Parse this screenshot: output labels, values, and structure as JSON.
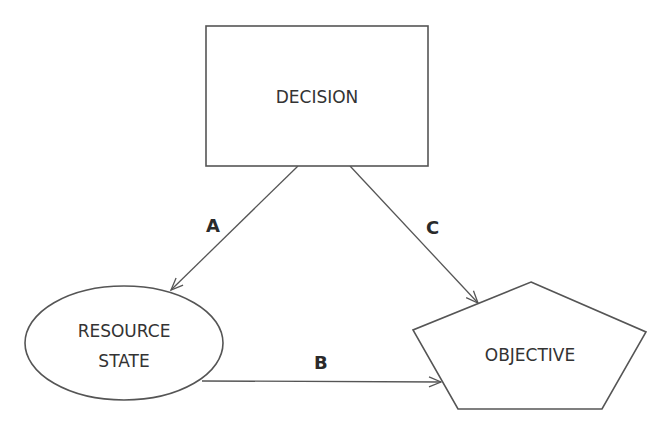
{
  "diagram": {
    "nodes": {
      "decision": {
        "label": "DECISION",
        "shape": "rectangle"
      },
      "resource_state": {
        "label_line1": "RESOURCE",
        "label_line2": "STATE",
        "shape": "ellipse"
      },
      "objective": {
        "label": "OBJECTIVE",
        "shape": "pentagon"
      }
    },
    "edges": {
      "a": {
        "label": "A",
        "from": "DECISION",
        "to": "RESOURCE STATE"
      },
      "b": {
        "label": "B",
        "from": "RESOURCE STATE",
        "to": "OBJECTIVE"
      },
      "c": {
        "label": "C",
        "from": "DECISION",
        "to": "OBJECTIVE"
      }
    },
    "colors": {
      "stroke": "#555555",
      "text": "#333333",
      "background": "#ffffff"
    }
  }
}
